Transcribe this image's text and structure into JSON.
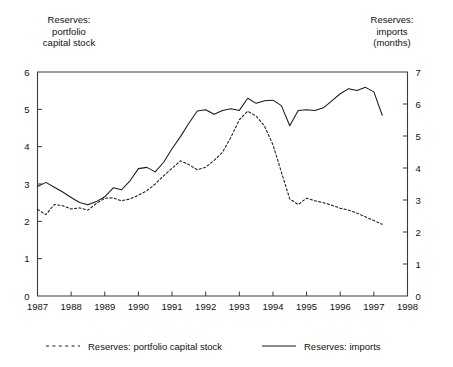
{
  "axis_titles": {
    "left": "Reserves:\nportfolio\ncapital stock",
    "right": "Reserves:\nimports\n(months)"
  },
  "legend": {
    "items": [
      {
        "label": "Reserves: portfolio capital stock",
        "style": "dashed",
        "color": "#1a1a1a"
      },
      {
        "label": "Reserves: imports",
        "style": "solid",
        "color": "#1a1a1a"
      }
    ]
  },
  "chart_data": {
    "type": "line",
    "title": "",
    "subtitle": "",
    "xlabel": "",
    "ylabel": "Reserves: portfolio capital stock",
    "y2label": "Reserves: imports (months)",
    "grid": false,
    "legend_position": "bottom",
    "xlim": [
      1987,
      1998
    ],
    "ylim": [
      0,
      6
    ],
    "y2lim": [
      0,
      7
    ],
    "x_tick_labels": [
      "1987",
      "1988",
      "1989",
      "1990",
      "1991",
      "1992",
      "1993",
      "1994",
      "1995",
      "1996",
      "1997",
      "1998"
    ],
    "y_tick_labels": [
      "0",
      "1",
      "2",
      "3",
      "4",
      "5",
      "6"
    ],
    "y2_tick_labels": [
      "0",
      "1",
      "2",
      "3",
      "4",
      "5",
      "6",
      "7"
    ],
    "frequency": "quarterly",
    "series": [
      {
        "name": "Reserves: portfolio capital stock",
        "axis": "left",
        "style": "dashed",
        "color": "#1a1a1a",
        "x": [
          1987.0,
          1987.25,
          1987.5,
          1987.75,
          1988.0,
          1988.25,
          1988.5,
          1988.75,
          1989.0,
          1989.25,
          1989.5,
          1989.75,
          1990.0,
          1990.25,
          1990.5,
          1990.75,
          1991.0,
          1991.25,
          1991.5,
          1991.75,
          1992.0,
          1992.25,
          1992.5,
          1992.75,
          1993.0,
          1993.25,
          1993.5,
          1993.75,
          1994.0,
          1994.25,
          1994.5,
          1994.75,
          1995.0,
          1995.25,
          1995.5,
          1995.75,
          1996.0,
          1996.25,
          1996.5,
          1996.75,
          1997.0,
          1997.25
        ],
        "y": [
          2.32,
          2.18,
          2.45,
          2.42,
          2.33,
          2.36,
          2.3,
          2.48,
          2.62,
          2.63,
          2.55,
          2.6,
          2.7,
          2.82,
          3.0,
          3.22,
          3.42,
          3.62,
          3.52,
          3.38,
          3.45,
          3.63,
          3.85,
          4.25,
          4.72,
          4.95,
          4.82,
          4.55,
          4.05,
          3.32,
          2.6,
          2.45,
          2.62,
          2.55,
          2.5,
          2.43,
          2.35,
          2.3,
          2.22,
          2.12,
          2.02,
          1.92
        ]
      },
      {
        "name": "Reserves: imports",
        "axis": "right",
        "style": "solid",
        "color": "#1a1a1a",
        "x": [
          1987.0,
          1987.25,
          1987.5,
          1987.75,
          1988.0,
          1988.25,
          1988.5,
          1988.75,
          1989.0,
          1989.25,
          1989.5,
          1989.75,
          1990.0,
          1990.25,
          1990.5,
          1990.75,
          1991.0,
          1991.25,
          1991.5,
          1991.75,
          1992.0,
          1992.25,
          1992.5,
          1992.75,
          1993.0,
          1993.25,
          1993.5,
          1993.75,
          1994.0,
          1994.25,
          1994.5,
          1994.75,
          1995.0,
          1995.25,
          1995.5,
          1995.75,
          1996.0,
          1996.25,
          1996.5,
          1996.75,
          1997.0,
          1997.25
        ],
        "y": [
          3.42,
          3.55,
          3.4,
          3.25,
          3.08,
          2.92,
          2.85,
          2.95,
          3.1,
          3.38,
          3.32,
          3.6,
          3.98,
          4.02,
          3.88,
          4.18,
          4.6,
          4.98,
          5.4,
          5.78,
          5.82,
          5.68,
          5.8,
          5.85,
          5.8,
          6.18,
          6.02,
          6.1,
          6.12,
          5.95,
          5.32,
          5.8,
          5.82,
          5.8,
          5.88,
          6.1,
          6.32,
          6.48,
          6.42,
          6.52,
          6.38,
          5.65
        ]
      }
    ]
  }
}
